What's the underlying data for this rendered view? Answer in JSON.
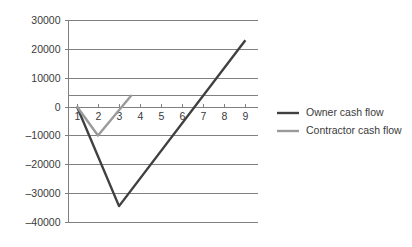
{
  "chart_data": {
    "type": "line",
    "title": "",
    "xlabel": "",
    "ylabel": "",
    "x": [
      1,
      2,
      3,
      4,
      5,
      6,
      7,
      8,
      9
    ],
    "xtick_labels": [
      "1",
      "2",
      "3",
      "4",
      "5",
      "6",
      "7",
      "8",
      "9"
    ],
    "ytick_labels": [
      "30000",
      "20000",
      "10000",
      "0",
      "-10000",
      "-20000",
      "-30000",
      "-40000"
    ],
    "ytick_values": [
      30000,
      20000,
      10000,
      0,
      -10000,
      -20000,
      -30000,
      -40000
    ],
    "xlim": [
      0.6,
      9.6
    ],
    "ylim": [
      -40000,
      30000
    ],
    "grid": true,
    "legend_position": "right",
    "series": [
      {
        "name": "Owner cash flow",
        "color": "#404040",
        "stroke_width": 2.4,
        "x": [
          1,
          3,
          9
        ],
        "values": [
          0,
          -34500,
          23000
        ]
      },
      {
        "name": "Contractor cash flow",
        "color": "#9a9a9a",
        "stroke_width": 2.4,
        "x": [
          1,
          2,
          3.6
        ],
        "values": [
          0,
          -10000,
          4000
        ]
      }
    ]
  },
  "legend": {
    "items": [
      {
        "label": "Owner cash flow",
        "color": "#404040"
      },
      {
        "label": "Contractor cash flow",
        "color": "#9a9a9a"
      }
    ]
  },
  "axes": {
    "y_axis_color": "#808080",
    "x_axis_color": "#808080",
    "gridline_color": "#808080"
  }
}
